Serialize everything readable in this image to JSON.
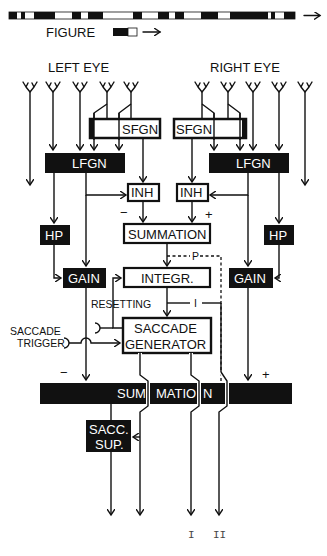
{
  "figure": {
    "stimulus_label": "FIGURE",
    "left_eye_label": "LEFT EYE",
    "right_eye_label": "RIGHT  EYE",
    "stripe_pattern": [
      [
        9,
        17,
        1
      ],
      [
        17,
        21,
        0
      ],
      [
        21,
        25,
        1
      ],
      [
        25,
        34,
        0
      ],
      [
        34,
        55,
        1
      ],
      [
        55,
        72,
        0
      ],
      [
        72,
        81,
        1
      ],
      [
        81,
        88,
        0
      ],
      [
        88,
        103,
        1
      ],
      [
        103,
        133,
        0
      ],
      [
        133,
        142,
        1
      ],
      [
        142,
        158,
        0
      ],
      [
        158,
        169,
        1
      ],
      [
        169,
        175,
        0
      ],
      [
        175,
        184,
        1
      ],
      [
        184,
        201,
        0
      ],
      [
        201,
        218,
        1
      ],
      [
        218,
        230,
        0
      ],
      [
        230,
        249,
        1
      ],
      [
        249,
        254,
        1
      ],
      [
        254,
        268,
        1
      ],
      [
        268,
        271,
        0
      ],
      [
        271,
        275,
        1
      ],
      [
        275,
        284,
        0
      ],
      [
        284,
        295,
        1
      ]
    ]
  },
  "blocks": {
    "sfgn_left": "SFGN",
    "sfgn_right": "SFGN",
    "lfgn_left": "LFGN",
    "lfgn_right": "LFGN",
    "inh_left": "INH",
    "inh_right": "INH",
    "hp_left": "HP",
    "hp_right": "HP",
    "summation": "SUMMATION",
    "gain_left": "GAIN",
    "gain_right": "GAIN",
    "integrator": "INTEGR.",
    "saccade_generator_line1": "SACCADE",
    "saccade_generator_line2": "GENERATOR",
    "summation_bar_part1": "SUM",
    "summation_bar_part2": "MATIO",
    "summation_bar_part3": "N",
    "sacc_sup_line1": "SACC.",
    "sacc_sup_line2": "SUP."
  },
  "labels": {
    "minus_inh": "−",
    "plus_inh": "+",
    "p_signal": "P",
    "i_signal": "I",
    "resetting": "RESETTING",
    "saccade_trigger_line1": "SACCADE",
    "saccade_trigger_line2": "TRIGGER",
    "minus_bar": "−",
    "plus_bar": "+",
    "output_I": "I",
    "output_II": "II"
  }
}
